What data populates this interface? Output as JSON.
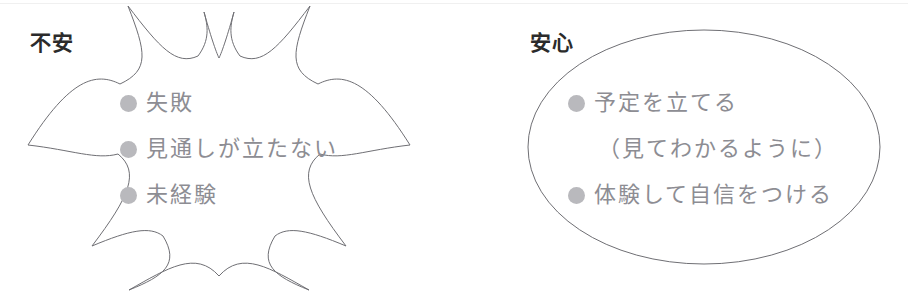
{
  "figure": {
    "background_color": "#ffffff",
    "outline_color": "#6f6f74",
    "text_color": "#8d8d93",
    "label_color": "#2b2b2b",
    "bullet_color": "#b9b9bd"
  },
  "groups": [
    {
      "id": "anxiety",
      "label": "不安",
      "shape": "starburst-callout",
      "items": [
        {
          "bullet": true,
          "text": "失敗"
        },
        {
          "bullet": true,
          "text": "見通しが立たない"
        },
        {
          "bullet": true,
          "text": "未経験"
        }
      ]
    },
    {
      "id": "relief",
      "label": "安心",
      "shape": "ellipse",
      "items": [
        {
          "bullet": true,
          "text": "予定を立てる"
        },
        {
          "bullet": false,
          "text": "（見てわかるように）"
        },
        {
          "bullet": true,
          "text": "体験して自信をつける"
        }
      ]
    }
  ]
}
